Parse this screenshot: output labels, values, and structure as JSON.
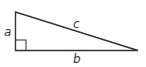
{
  "diagram": {
    "type": "right-triangle",
    "labels": {
      "vertical_leg": "a",
      "horizontal_leg": "b",
      "hypotenuse": "c"
    },
    "right_angle_marker": true,
    "colors": {
      "stroke": "#333333",
      "label": "#333333",
      "background": "#ffffff"
    }
  }
}
